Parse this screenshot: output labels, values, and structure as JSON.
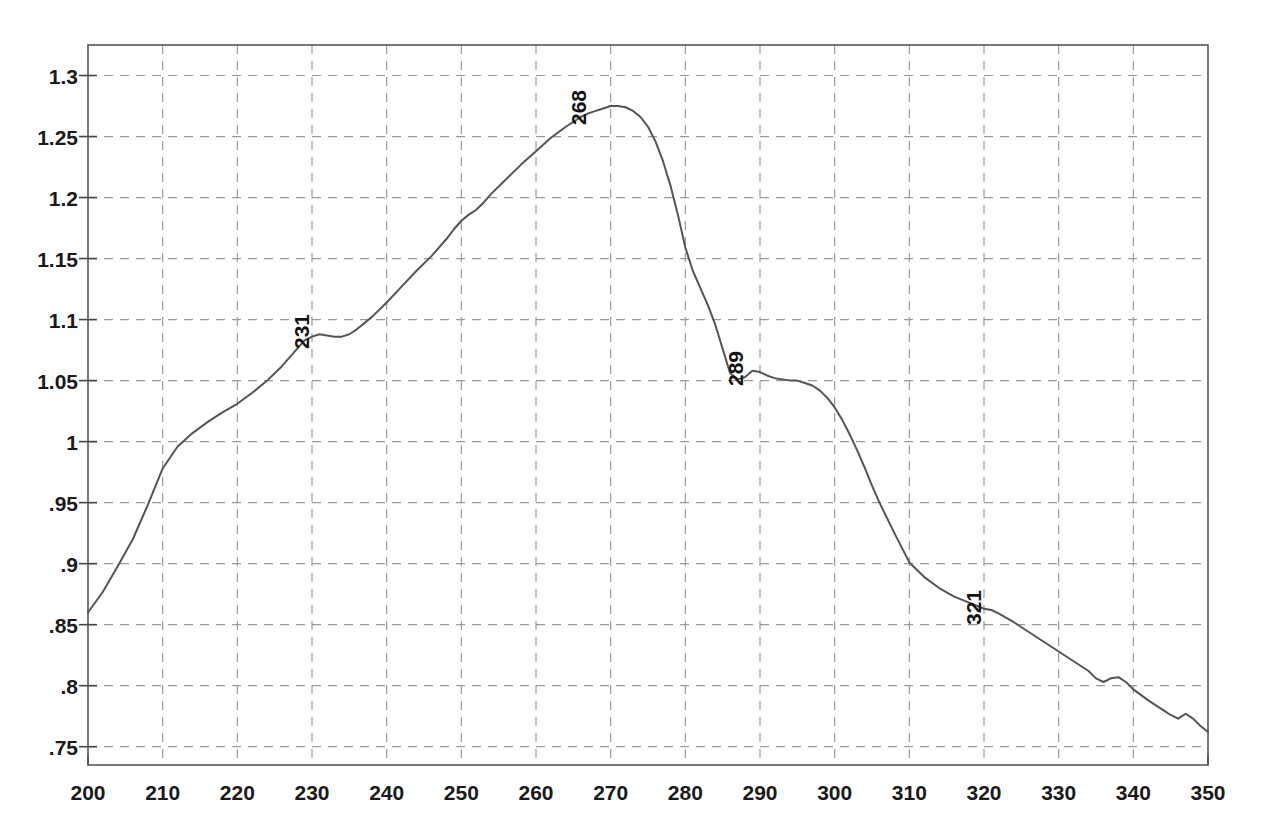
{
  "chart_data": {
    "type": "line",
    "title": "",
    "xlabel": "",
    "ylabel": "",
    "xlim": [
      200,
      350
    ],
    "ylim": [
      0.735,
      1.325
    ],
    "grid": true,
    "legend": false,
    "line_color": "#555555",
    "grid_color": "#9a9a9a",
    "frame_color": "#555555",
    "background_color": "#ffffff",
    "xticks": [
      200,
      210,
      220,
      230,
      240,
      250,
      260,
      270,
      280,
      290,
      300,
      310,
      320,
      330,
      340,
      350
    ],
    "xtick_labels": [
      "200",
      "210",
      "220",
      "230",
      "240",
      "250",
      "260",
      "270",
      "280",
      "290",
      "300",
      "310",
      "320",
      "330",
      "340",
      "350"
    ],
    "yticks": [
      0.75,
      0.8,
      0.85,
      0.9,
      0.95,
      1.0,
      1.05,
      1.1,
      1.15,
      1.2,
      1.25,
      1.3
    ],
    "ytick_labels": [
      ".75",
      ".8",
      ".85",
      ".9",
      ".95",
      "1",
      "1.05",
      "1.1",
      "1.15",
      "1.2",
      "1.25",
      "1.3"
    ],
    "annotations": [
      {
        "label": "231",
        "x": 231,
        "y": 1.088,
        "rotation": 90
      },
      {
        "label": "268",
        "x": 268,
        "y": 1.272,
        "rotation": 90
      },
      {
        "label": "289",
        "x": 289,
        "y": 1.058,
        "rotation": 90
      },
      {
        "label": "321",
        "x": 321,
        "y": 0.862,
        "rotation": 90
      }
    ],
    "series": [
      {
        "name": "absorbance",
        "x": [
          200,
          202,
          204,
          206,
          208,
          210,
          212,
          214,
          216,
          218,
          220,
          222,
          224,
          226,
          228,
          229,
          230,
          231,
          232,
          233,
          234,
          235,
          236,
          238,
          240,
          242,
          244,
          246,
          248,
          249,
          250,
          251,
          252,
          253,
          254,
          256,
          258,
          260,
          262,
          264,
          266,
          267,
          268,
          269,
          270,
          271,
          272,
          273,
          274,
          275,
          276,
          277,
          278,
          279,
          280,
          281,
          282,
          283,
          284,
          285,
          286,
          287,
          288,
          289,
          290,
          291,
          292,
          293,
          294,
          295,
          296,
          297,
          298,
          299,
          300,
          301,
          302,
          303,
          304,
          305,
          306,
          308,
          310,
          312,
          314,
          316,
          318,
          320,
          321,
          322,
          324,
          326,
          328,
          330,
          332,
          334,
          335,
          336,
          337,
          338,
          339,
          340,
          342,
          344,
          345,
          346,
          347,
          348,
          349,
          350
        ],
        "y": [
          0.86,
          0.877,
          0.898,
          0.92,
          0.948,
          0.978,
          0.996,
          1.007,
          1.016,
          1.024,
          1.031,
          1.04,
          1.05,
          1.062,
          1.076,
          1.083,
          1.086,
          1.088,
          1.087,
          1.086,
          1.086,
          1.088,
          1.092,
          1.102,
          1.114,
          1.127,
          1.14,
          1.152,
          1.166,
          1.174,
          1.181,
          1.186,
          1.19,
          1.196,
          1.203,
          1.215,
          1.227,
          1.238,
          1.249,
          1.258,
          1.266,
          1.269,
          1.271,
          1.273,
          1.275,
          1.275,
          1.274,
          1.271,
          1.266,
          1.258,
          1.246,
          1.23,
          1.21,
          1.186,
          1.159,
          1.14,
          1.126,
          1.112,
          1.096,
          1.076,
          1.056,
          1.051,
          1.053,
          1.058,
          1.057,
          1.054,
          1.052,
          1.051,
          1.05,
          1.05,
          1.048,
          1.046,
          1.042,
          1.036,
          1.028,
          1.018,
          1.006,
          0.993,
          0.979,
          0.964,
          0.95,
          0.925,
          0.901,
          0.889,
          0.88,
          0.873,
          0.868,
          0.863,
          0.862,
          0.859,
          0.852,
          0.844,
          0.836,
          0.828,
          0.82,
          0.812,
          0.806,
          0.803,
          0.806,
          0.807,
          0.803,
          0.797,
          0.788,
          0.78,
          0.776,
          0.773,
          0.777,
          0.773,
          0.767,
          0.762
        ]
      }
    ]
  }
}
